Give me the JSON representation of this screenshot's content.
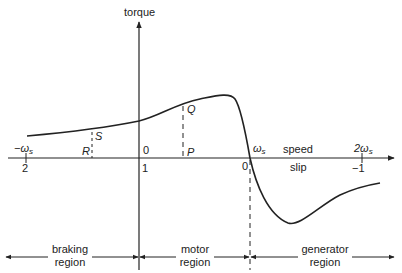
{
  "diagram": {
    "axes": {
      "y_label": "torque",
      "x_label_top": "speed",
      "x_label_bottom": "slip"
    },
    "speed_ticks": [
      {
        "main": "−ω",
        "sub": "s"
      },
      {
        "main": "0",
        "sub": ""
      },
      {
        "main": "ω",
        "sub": "s"
      },
      {
        "main": "2ω",
        "sub": "s"
      }
    ],
    "slip_ticks": [
      "2",
      "1",
      "0",
      "−1"
    ],
    "points": {
      "S": "S",
      "R": "R",
      "Q": "Q",
      "P": "P"
    },
    "regions": [
      {
        "line1": "braking",
        "line2": "region"
      },
      {
        "line1": "motor",
        "line2": "region"
      },
      {
        "line1": "generator",
        "line2": "region"
      }
    ],
    "colors": {
      "line": "#222222",
      "text": "#222222",
      "background": "#ffffff"
    }
  }
}
